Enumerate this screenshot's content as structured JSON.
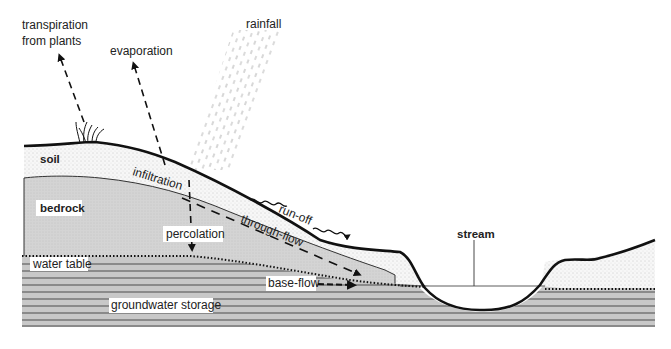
{
  "diagram": {
    "type": "cross-section",
    "labels": {
      "transpiration_line1": "transpiration",
      "transpiration_line2": "from plants",
      "evaporation": "evaporation",
      "rainfall": "rainfall",
      "soil": "soil",
      "bedrock": "bedrock",
      "infiltration": "infiltration",
      "run_off": "run-off",
      "through_flow": "through-flow",
      "percolation": "percolation",
      "water_table": "water table",
      "stream": "stream",
      "base_flow": "base-flow",
      "groundwater_storage": "groundwater storage"
    },
    "colors": {
      "ink": "#111111",
      "soil_fill": "#f4f4f4",
      "bedrock_fill": "#d2d2d2",
      "groundwater_fill": "#c8c8c8",
      "groundwater_lines": "#555555",
      "rain": "#888888"
    }
  }
}
